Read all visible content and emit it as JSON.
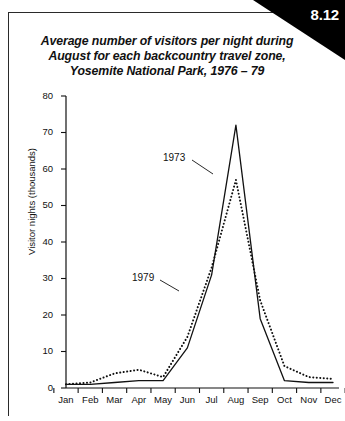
{
  "badge": {
    "number": "8.12"
  },
  "title": {
    "line1": "Average number of visitors per night during",
    "line2": "August for each backcountry travel zone,",
    "line3": "Yosemite National Park, 1976 – 79"
  },
  "axes": {
    "ylabel": "Visitor nights (thousands)",
    "yticks": [
      "0",
      "10",
      "20",
      "30",
      "40",
      "50",
      "60",
      "70",
      "80"
    ],
    "xticks": [
      "Jan",
      "Feb",
      "Mar",
      "Apr",
      "May",
      "Jun",
      "Jul",
      "Aug",
      "Sep",
      "Oct",
      "Nov",
      "Dec"
    ]
  },
  "annotations": {
    "label_1973": "1973",
    "label_1979": "1979"
  },
  "colors": {
    "ink": "#111111",
    "badge_bg": "#000000",
    "badge_text": "#ffffff",
    "background": "#ffffff"
  },
  "chart_data": {
    "type": "line",
    "title": "Average number of visitors per night during August for each backcountry travel zone, Yosemite National Park, 1976 – 79",
    "xlabel": "",
    "ylabel": "Visitor nights (thousands)",
    "categories": [
      "Jan",
      "Feb",
      "Mar",
      "Apr",
      "May",
      "Jun",
      "Jul",
      "Aug",
      "Sep",
      "Oct",
      "Nov",
      "Dec"
    ],
    "ylim": [
      0,
      80
    ],
    "xlim": [
      "Jan",
      "Dec"
    ],
    "ytick_step": 10,
    "grid": false,
    "legend": "inline-annotations",
    "series": [
      {
        "name": "1973",
        "style": "solid",
        "values": [
          1,
          1,
          1.5,
          2,
          2,
          11,
          31,
          72,
          19,
          2,
          1.5,
          1.5
        ]
      },
      {
        "name": "1979",
        "style": "dotted",
        "values": [
          1,
          1.5,
          4,
          5,
          3,
          14,
          33,
          57,
          24,
          6,
          3,
          2.5
        ]
      }
    ]
  }
}
